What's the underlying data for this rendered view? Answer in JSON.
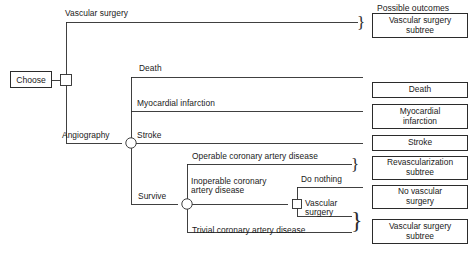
{
  "figure": {
    "type": "decision-tree",
    "header_label": "Possible outcomes",
    "caption": ""
  },
  "root": {
    "label": "Choose",
    "node_type": "decision-square"
  },
  "nodes": {
    "angiography_chance": "chance-circle",
    "survive_chance": "chance-circle",
    "inoperable_decision": "decision-square"
  },
  "branches": {
    "vascular_surgery": "Vascular surgery",
    "angiography": "Angiography",
    "death": "Death",
    "myocardial_infarction": "Myocardial infarction",
    "stroke": "Stroke",
    "survive": "Survive",
    "operable": "Operable coronary artery disease",
    "inoperable_line1": "Inoperable coronary",
    "inoperable_line2": "artery disease",
    "trivial": "Trivial coronary artery disease",
    "do_nothing": "Do nothing",
    "vascular_surgery_sub_line1": "Vascular",
    "vascular_surgery_sub_line2": "surgery"
  },
  "outcomes": [
    {
      "id": "vascular-surgery-subtree-top",
      "line1": "Vascular  surgery",
      "line2": "subtree",
      "braced": true
    },
    {
      "id": "death",
      "line1": "Death",
      "line2": "",
      "braced": false
    },
    {
      "id": "myocardial-infarction",
      "line1": "Myocardial",
      "line2": "infarction",
      "braced": false
    },
    {
      "id": "stroke",
      "line1": "Stroke",
      "line2": "",
      "braced": false
    },
    {
      "id": "revascularization-subtree",
      "line1": "Revascularization",
      "line2": "subtree",
      "braced": true
    },
    {
      "id": "no-vascular-surgery",
      "line1": "No vascular",
      "line2": "surgery",
      "braced": false
    },
    {
      "id": "vascular-surgery-subtree-bottom",
      "line1": "Vascular surgery",
      "line2": "subtree",
      "braced": true
    }
  ],
  "colors": {
    "line": "#2b2b2b",
    "text": "#1a1a1a",
    "background": "#ffffff"
  }
}
